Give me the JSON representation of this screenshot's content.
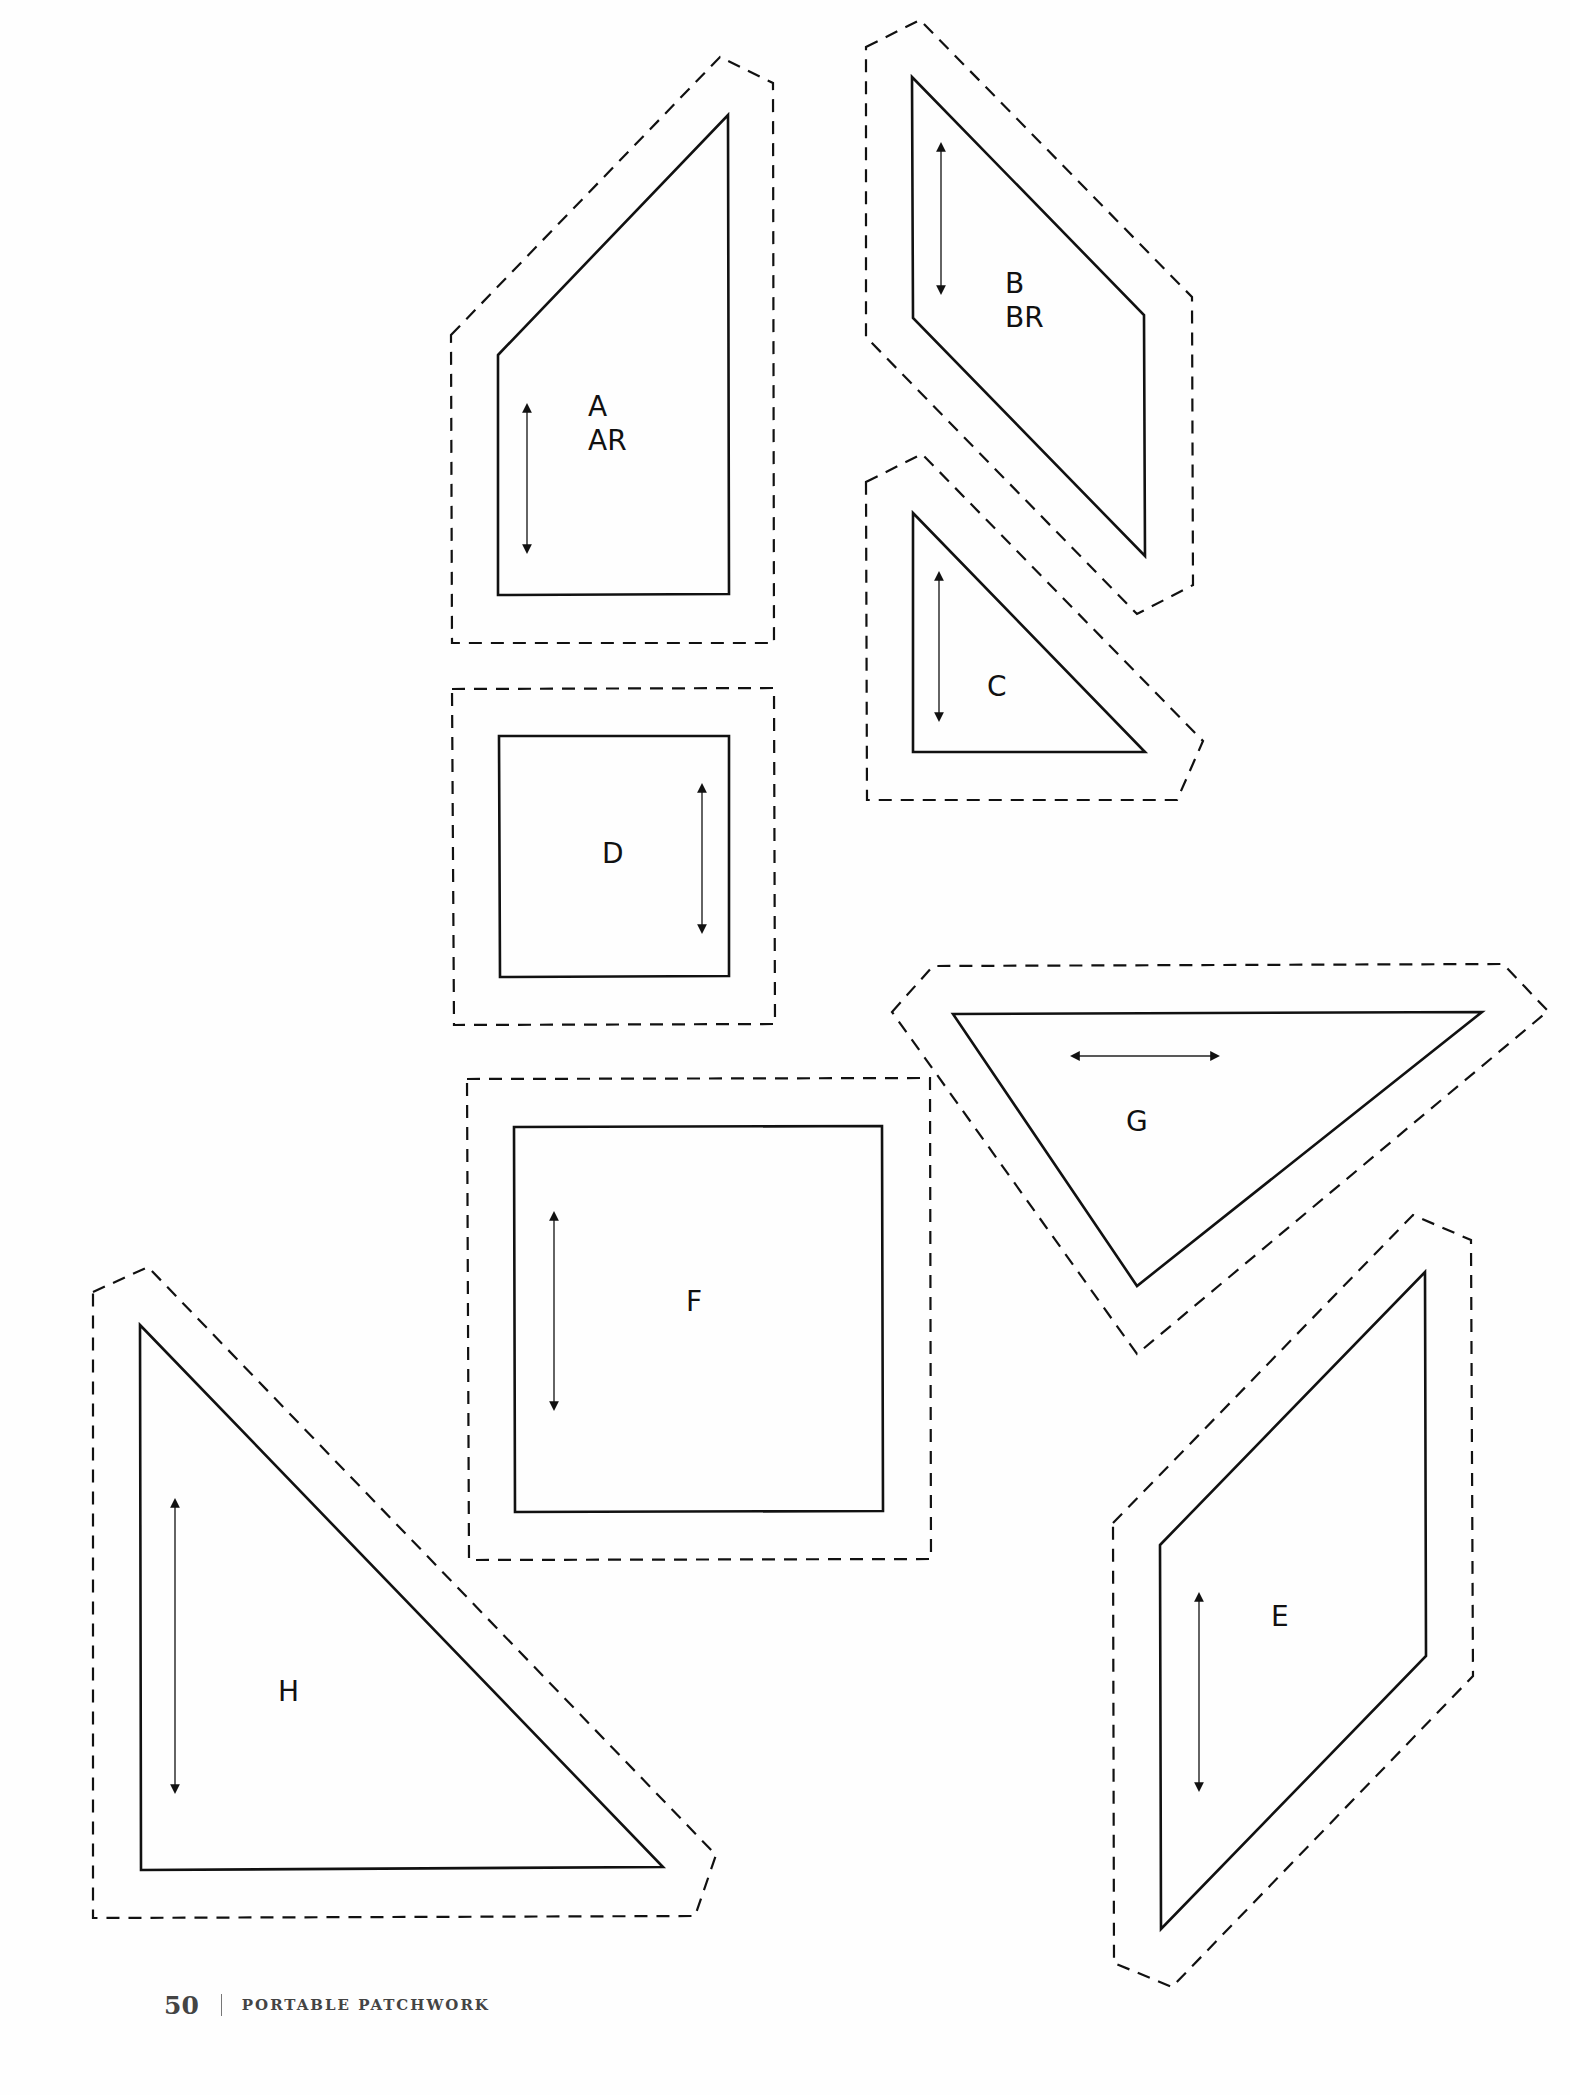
{
  "page": {
    "background": "#fefefe",
    "line_color": "#111111"
  },
  "pieces": [
    {
      "id": "A",
      "labels": [
        "A",
        "AR"
      ],
      "grain": "vertical",
      "seam_outline": [
        [
          451,
          335
        ],
        [
          720,
          57
        ],
        [
          773,
          83
        ],
        [
          774,
          643
        ],
        [
          452,
          643
        ]
      ],
      "cut_outline": [
        [
          498,
          355
        ],
        [
          728,
          115
        ],
        [
          729,
          594
        ],
        [
          498,
          595
        ]
      ],
      "grain_arrow": [
        [
          527,
          405
        ],
        [
          527,
          552
        ]
      ],
      "label_pos": [
        588,
        390
      ]
    },
    {
      "id": "B",
      "labels": [
        "B",
        "BR"
      ],
      "grain": "vertical",
      "seam_outline": [
        [
          866,
          47
        ],
        [
          920,
          20
        ],
        [
          1192,
          297
        ],
        [
          1193,
          585
        ],
        [
          1137,
          614
        ],
        [
          866,
          337
        ]
      ],
      "cut_outline": [
        [
          912,
          77
        ],
        [
          1144,
          315
        ],
        [
          1145,
          556
        ],
        [
          913,
          318
        ]
      ],
      "grain_arrow": [
        [
          941,
          144
        ],
        [
          941,
          293
        ]
      ],
      "label_pos": [
        1005,
        267
      ]
    },
    {
      "id": "C",
      "labels": [
        "C"
      ],
      "grain": "vertical",
      "seam_outline": [
        [
          866,
          482
        ],
        [
          922,
          454
        ],
        [
          1203,
          741
        ],
        [
          1177,
          800
        ],
        [
          867,
          800
        ]
      ],
      "cut_outline": [
        [
          913,
          513
        ],
        [
          1145,
          752
        ],
        [
          913,
          752
        ]
      ],
      "grain_arrow": [
        [
          939,
          573
        ],
        [
          939,
          720
        ]
      ],
      "label_pos": [
        987,
        670
      ]
    },
    {
      "id": "D",
      "labels": [
        "D"
      ],
      "grain": "vertical",
      "seam_outline": [
        [
          452,
          689
        ],
        [
          774,
          688
        ],
        [
          775,
          1024
        ],
        [
          454,
          1025
        ]
      ],
      "cut_outline": [
        [
          499,
          736
        ],
        [
          729,
          736
        ],
        [
          729,
          976
        ],
        [
          500,
          977
        ]
      ],
      "grain_arrow": [
        [
          702,
          785
        ],
        [
          702,
          932
        ]
      ],
      "label_pos": [
        602,
        837
      ]
    },
    {
      "id": "E",
      "labels": [
        "E"
      ],
      "grain": "vertical",
      "seam_outline": [
        [
          1113,
          1523
        ],
        [
          1413,
          1215
        ],
        [
          1471,
          1240
        ],
        [
          1473,
          1676
        ],
        [
          1172,
          1987
        ],
        [
          1114,
          1963
        ]
      ],
      "cut_outline": [
        [
          1160,
          1545
        ],
        [
          1425,
          1272
        ],
        [
          1426,
          1656
        ],
        [
          1161,
          1929
        ]
      ],
      "grain_arrow": [
        [
          1199,
          1594
        ],
        [
          1199,
          1790
        ]
      ],
      "label_pos": [
        1271,
        1600
      ]
    },
    {
      "id": "F",
      "labels": [
        "F"
      ],
      "grain": "vertical",
      "seam_outline": [
        [
          467,
          1079
        ],
        [
          930,
          1078
        ],
        [
          931,
          1559
        ],
        [
          469,
          1560
        ]
      ],
      "cut_outline": [
        [
          514,
          1127
        ],
        [
          882,
          1126
        ],
        [
          883,
          1511
        ],
        [
          515,
          1512
        ]
      ],
      "grain_arrow": [
        [
          554,
          1213
        ],
        [
          554,
          1409
        ]
      ],
      "label_pos": [
        686,
        1285
      ]
    },
    {
      "id": "G",
      "labels": [
        "G"
      ],
      "grain": "horizontal",
      "seam_outline": [
        [
          892,
          1012
        ],
        [
          933,
          966
        ],
        [
          1503,
          964
        ],
        [
          1548,
          1011
        ],
        [
          1137,
          1354
        ]
      ],
      "cut_outline": [
        [
          953,
          1014
        ],
        [
          1482,
          1012
        ],
        [
          1137,
          1286
        ]
      ],
      "grain_arrow": [
        [
          1072,
          1056
        ],
        [
          1218,
          1056
        ]
      ],
      "label_pos": [
        1126,
        1105
      ]
    },
    {
      "id": "H",
      "labels": [
        "H"
      ],
      "grain": "vertical",
      "seam_outline": [
        [
          93,
          1292
        ],
        [
          148,
          1267
        ],
        [
          716,
          1855
        ],
        [
          695,
          1916
        ],
        [
          93,
          1918
        ]
      ],
      "cut_outline": [
        [
          140,
          1325
        ],
        [
          663,
          1867
        ],
        [
          141,
          1870
        ]
      ],
      "grain_arrow": [
        [
          175,
          1500
        ],
        [
          175,
          1792
        ]
      ],
      "label_pos": [
        278,
        1675
      ]
    }
  ],
  "footer": {
    "page_number": "50",
    "book_title": "PORTABLE PATCHWORK"
  }
}
